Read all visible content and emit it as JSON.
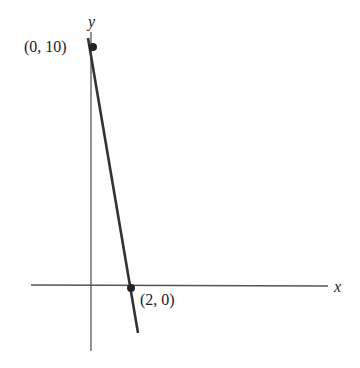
{
  "axes": {
    "x_label": "x",
    "y_label": "y"
  },
  "points": [
    {
      "label": "(0, 10)",
      "x": 0,
      "y": 10
    },
    {
      "label": "(2, 0)",
      "x": 2,
      "y": 0
    }
  ],
  "line": {
    "equation": "through (0,10) and (2,0)",
    "color": "#333333"
  }
}
